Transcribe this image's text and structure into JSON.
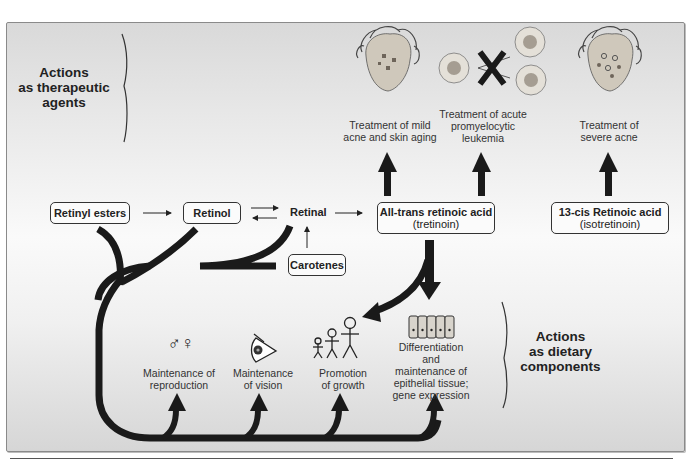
{
  "colors": {
    "arrow": "#1a1a1a",
    "panel_top": "#d9d9d9",
    "panel_mid": "#fafafa",
    "panel_bottom": "#d6d6d6",
    "box_border": "#333333",
    "skin": "#c8c0b0",
    "lesion": "#7d746a"
  },
  "sections": {
    "therapeutic": {
      "line1": "Actions",
      "line2": "as therapeutic",
      "line3": "agents"
    },
    "dietary": {
      "line1": "Actions",
      "line2": "as dietary",
      "line3": "components"
    }
  },
  "therapeutic_effects": [
    {
      "id": "mild-acne",
      "icon": "face-with-lesions-icon",
      "line1": "Treatment of mild",
      "line2": "acne and skin aging"
    },
    {
      "id": "apl",
      "icon": "blocked-cell-division-icon",
      "line1": "Treatment of acute",
      "line2": "promyelocytic",
      "line3": "leukemia"
    },
    {
      "id": "severe-acne",
      "icon": "face-with-severe-lesions-icon",
      "line1": "Treatment of",
      "line2": "severe acne"
    }
  ],
  "pathway": {
    "retinyl_esters": "Retinyl esters",
    "retinol": "Retinol",
    "retinal": "Retinal",
    "carotenes": "Carotenes",
    "atra": {
      "line1": "All-trans retinoic acid",
      "line2": "(tretinoin)"
    },
    "cis13": {
      "line1": "13-cis Retinoic acid",
      "line2": "(isotretinoin)"
    }
  },
  "dietary_effects": [
    {
      "id": "reproduction",
      "icon": "male-female-symbols-icon",
      "line1": "Maintenance of",
      "line2": "reproduction"
    },
    {
      "id": "vision",
      "icon": "eye-icon",
      "line1": "Maintenance",
      "line2": "of vision"
    },
    {
      "id": "growth",
      "icon": "growing-figures-icon",
      "line1": "Promotion",
      "line2": "of growth"
    },
    {
      "id": "epithelial",
      "icon": "epithelial-cells-icon",
      "line1": "Differentiation",
      "line2": "and",
      "line3": "maintenance of",
      "line4": "epithelial tissue;",
      "line5": "gene expression"
    }
  ],
  "glyphs": {
    "male_female": "♂♀"
  }
}
